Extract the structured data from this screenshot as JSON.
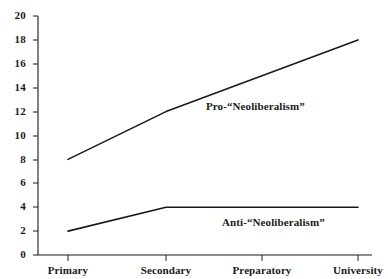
{
  "chart_data": {
    "type": "line",
    "title": "",
    "subtitle": "",
    "xlabel": "",
    "ylabel": "",
    "categories": [
      "Primary",
      "Secondary",
      "Preparatory",
      "University"
    ],
    "series": [
      {
        "name": "Pro-“Neoliberalism”",
        "values": [
          8,
          12,
          15,
          18
        ]
      },
      {
        "name": "Anti-“Neoliberalism”",
        "values": [
          2,
          4,
          4,
          4
        ]
      }
    ],
    "ylim": [
      0,
      20
    ],
    "ytick_labels": [
      "0",
      "2",
      "4",
      "6",
      "8",
      "10",
      "12",
      "14",
      "16",
      "18",
      "20"
    ],
    "ytick_values": [
      0,
      2,
      4,
      6,
      8,
      10,
      12,
      14,
      16,
      18,
      20
    ],
    "grid": false,
    "legend_position": "inline-annotation",
    "annotations": [
      {
        "text": "Pro-“Neoliberalism”",
        "series": "Pro-“Neoliberalism”"
      },
      {
        "text": "Anti-“Neoliberalism”",
        "series": "Anti-“Neoliberalism”"
      }
    ],
    "colors": {
      "line": "#1a1a1a",
      "axis": "#1a1a1a",
      "background": "#ffffff",
      "text": "#1a1a1a"
    }
  }
}
